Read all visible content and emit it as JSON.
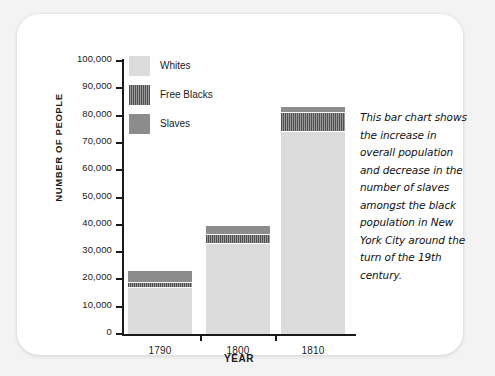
{
  "chart_data": {
    "type": "bar",
    "subtype": "stacked",
    "title": "",
    "xlabel": "YEAR",
    "ylabel": "NUMBER OF PEOPLE",
    "categories": [
      "1790",
      "1800",
      "1810"
    ],
    "ylim": [
      0,
      100000
    ],
    "ytick_labels": [
      "100,000",
      "90,000",
      "80,000",
      "70,000",
      "60,000",
      "50,000",
      "40,000",
      "30,000",
      "20,000",
      "10,000",
      "0"
    ],
    "ytick_values": [
      100000,
      90000,
      80000,
      70000,
      60000,
      50000,
      40000,
      30000,
      20000,
      10000,
      0
    ],
    "grid": false,
    "legend_position": "inside-top-left",
    "series": [
      {
        "name": "Whites",
        "color": "#dcdcdc",
        "pattern": "solid",
        "values": [
          17000,
          33000,
          74000
        ]
      },
      {
        "name": "Free Blacks",
        "color": "#585858",
        "pattern": "vertical-stripes",
        "values": [
          2000,
          3500,
          7500
        ]
      },
      {
        "name": "Slaves",
        "color": "#8c8c8c",
        "pattern": "solid",
        "values": [
          4000,
          3000,
          1500
        ]
      }
    ],
    "totals": [
      23000,
      39500,
      83000
    ],
    "annotation": "This bar chart shows the increase in overall population and decrease in the number of slaves amongst the black population in New York City around the turn of the 19th century."
  },
  "colors": {
    "page_background": "#f3f3f3",
    "card_background": "#ffffff",
    "axis": "#1a1a1a",
    "text": "#1a1a1a"
  }
}
